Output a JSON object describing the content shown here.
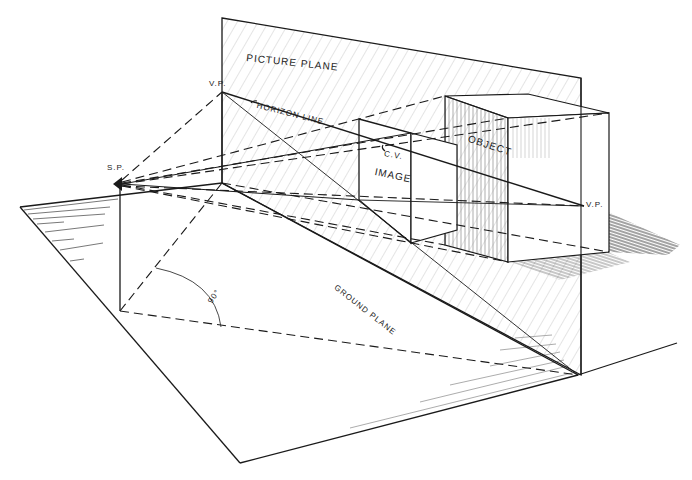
{
  "diagram": {
    "labels": {
      "picture_plane": "PICTURE PLANE",
      "vp_left": "V.P.",
      "horizon_line": "HORIZON LINE",
      "station_point": "S.P.",
      "center_of_vision": "C.V.",
      "image": "IMAGE",
      "object": "OBJECT",
      "vp_right": "V.P.",
      "angle": "90°",
      "ground_plane": "GROUND PLANE"
    },
    "colors": {
      "ink": "#1a1a1a",
      "hatch": "#9a9a9a",
      "background": "#ffffff"
    }
  }
}
